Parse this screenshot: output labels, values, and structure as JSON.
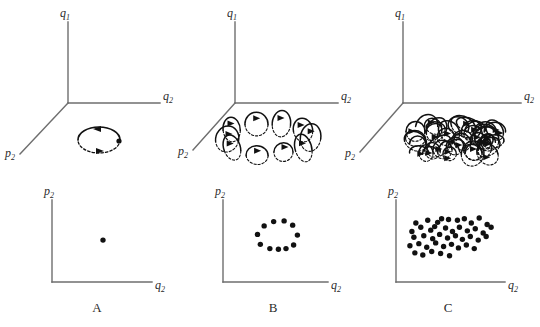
{
  "figure": {
    "background": "#ffffff",
    "ink_color": "#111111",
    "axis_color": "#6e6e6e"
  },
  "labels": {
    "q1": "q",
    "q1_sub": "1",
    "q2": "q",
    "q2_sub": "2",
    "p2": "p",
    "p2_sub": "2"
  },
  "panels": [
    {
      "id": "A",
      "letter": "A",
      "regime": "periodic",
      "top_axes": {
        "vertical": "q1",
        "horizontal": "q2",
        "depth": "p2"
      },
      "bottom_axes": {
        "vertical": "p2",
        "horizontal": "q2"
      },
      "trajectory_description": "single closed elliptical orbit, solid upper half and dashed lower half, two arrowheads",
      "loop_count": 1,
      "section_point_count": 1
    },
    {
      "id": "B",
      "letter": "B",
      "regime": "quasi-periodic",
      "top_axes": {
        "vertical": "q1",
        "horizontal": "q2",
        "depth": "p2"
      },
      "bottom_axes": {
        "vertical": "p2",
        "horizontal": "q2"
      },
      "trajectory_description": "winding trajectory on a torus, about ten overlapping loops with arrowheads",
      "loop_count": 10,
      "section_point_count": 11
    },
    {
      "id": "C",
      "letter": "C",
      "regime": "chaotic",
      "top_axes": {
        "vertical": "q1",
        "horizontal": "q2",
        "depth": "p2"
      },
      "bottom_axes": {
        "vertical": "p2",
        "horizontal": "q2"
      },
      "trajectory_description": "dense chaotic tangle filling a flattened region of phase space",
      "loop_count": 46,
      "section_point_count": 45
    }
  ],
  "chart_data": {
    "type": "scatter",
    "xlabel": "q2",
    "ylabel": "p2",
    "grid": false,
    "legend": "none",
    "xlim": [
      0,
      100
    ],
    "ylim": [
      0,
      100
    ],
    "series": [
      {
        "name": "A",
        "points": [
          [
            50,
            52
          ]
        ]
      },
      {
        "name": "B",
        "points": [
          [
            47,
            78
          ],
          [
            58,
            79
          ],
          [
            37,
            72
          ],
          [
            67,
            73
          ],
          [
            30,
            60
          ],
          [
            72,
            59
          ],
          [
            33,
            46
          ],
          [
            68,
            45
          ],
          [
            43,
            40
          ],
          [
            52,
            39
          ],
          [
            60,
            40
          ]
        ]
      },
      {
        "name": "C",
        "points": [
          [
            14,
            76
          ],
          [
            26,
            80
          ],
          [
            36,
            77
          ],
          [
            40,
            82
          ],
          [
            47,
            81
          ],
          [
            56,
            80
          ],
          [
            63,
            82
          ],
          [
            70,
            76
          ],
          [
            78,
            83
          ],
          [
            86,
            74
          ],
          [
            10,
            64
          ],
          [
            19,
            70
          ],
          [
            29,
            66
          ],
          [
            33,
            71
          ],
          [
            44,
            69
          ],
          [
            51,
            64
          ],
          [
            58,
            70
          ],
          [
            66,
            65
          ],
          [
            74,
            68
          ],
          [
            82,
            62
          ],
          [
            90,
            70
          ],
          [
            12,
            56
          ],
          [
            22,
            58
          ],
          [
            31,
            54
          ],
          [
            38,
            60
          ],
          [
            46,
            55
          ],
          [
            54,
            58
          ],
          [
            61,
            53
          ],
          [
            69,
            57
          ],
          [
            77,
            52
          ],
          [
            85,
            57
          ],
          [
            8,
            44
          ],
          [
            17,
            47
          ],
          [
            25,
            42
          ],
          [
            34,
            48
          ],
          [
            42,
            43
          ],
          [
            50,
            46
          ],
          [
            57,
            41
          ],
          [
            65,
            45
          ],
          [
            73,
            40
          ],
          [
            13,
            34
          ],
          [
            21,
            31
          ],
          [
            30,
            36
          ],
          [
            39,
            33
          ],
          [
            48,
            30
          ]
        ]
      }
    ]
  }
}
